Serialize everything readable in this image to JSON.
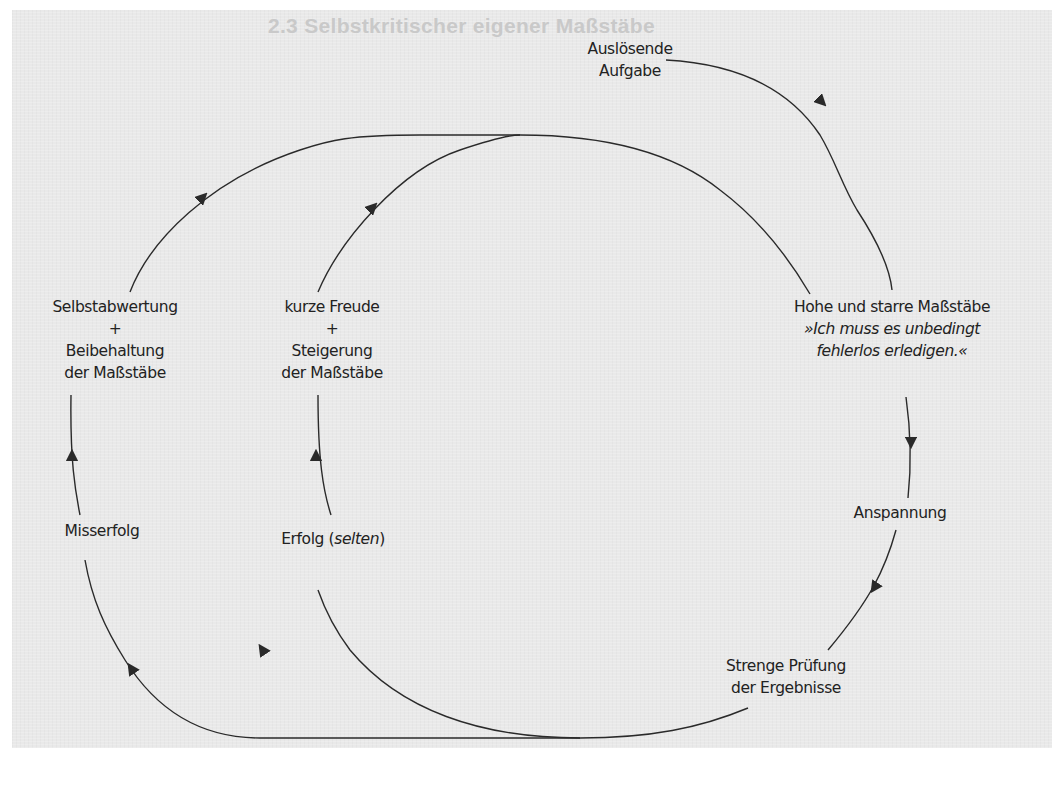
{
  "page": {
    "faded_heading": "2.3 Selbstkritischer eigener Maßstäbe"
  },
  "diagram": {
    "type": "cycle",
    "line_color": "#2a2a2a",
    "background": "#e9e9e9",
    "nodes": {
      "trigger": {
        "line1": "Auslösende",
        "line2": "Aufgabe"
      },
      "standards": {
        "title": "Hohe und starre Maßstäbe",
        "quote_line1": "»Ich muss es unbedingt",
        "quote_line2": "fehlerlos erledigen.«"
      },
      "tension": {
        "label": "Anspannung"
      },
      "review": {
        "line1": "Strenge Prüfung",
        "line2": "der Ergebnisse"
      },
      "failure": {
        "label": "Misserfolg"
      },
      "success": {
        "label": "Erfolg (",
        "italic": "selten",
        "close": ")"
      },
      "devaluation": {
        "line1": "Selbstabwertung",
        "plus": "+",
        "line2": "Beibehaltung",
        "line3": "der Maßstäbe"
      },
      "joy": {
        "line1": "kurze Freude",
        "plus": "+",
        "line2": "Steigerung",
        "line3": "der Maßstäbe"
      }
    },
    "edges": [
      {
        "from": "Auslösende Aufgabe",
        "to": "Hohe und starre Maßstäbe"
      },
      {
        "from": "Hohe und starre Maßstäbe",
        "to": "Anspannung"
      },
      {
        "from": "Anspannung",
        "to": "Strenge Prüfung der Ergebnisse"
      },
      {
        "from": "Strenge Prüfung der Ergebnisse",
        "to": "Misserfolg"
      },
      {
        "from": "Strenge Prüfung der Ergebnisse",
        "to": "Erfolg (selten)"
      },
      {
        "from": "Misserfolg",
        "to": "Selbstabwertung + Beibehaltung der Maßstäbe"
      },
      {
        "from": "Erfolg (selten)",
        "to": "kurze Freude + Steigerung der Maßstäbe"
      },
      {
        "from": "Selbstabwertung + Beibehaltung der Maßstäbe",
        "to": "Hohe und starre Maßstäbe"
      },
      {
        "from": "kurze Freude + Steigerung der Maßstäbe",
        "to": "Hohe und starre Maßstäbe"
      }
    ]
  }
}
